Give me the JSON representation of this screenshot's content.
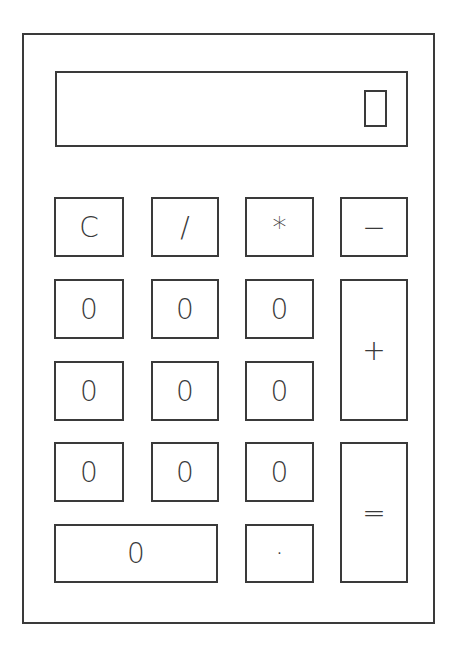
{
  "display": {
    "value": ""
  },
  "keys": [
    {
      "id": "clear",
      "label": "C"
    },
    {
      "id": "divide",
      "label": "/"
    },
    {
      "id": "multiply",
      "label": "*"
    },
    {
      "id": "minus",
      "label": "−"
    },
    {
      "id": "digit-r2c1",
      "label": "0"
    },
    {
      "id": "digit-r2c2",
      "label": "0"
    },
    {
      "id": "digit-r2c3",
      "label": "0"
    },
    {
      "id": "plus",
      "label": "+"
    },
    {
      "id": "digit-r3c1",
      "label": "0"
    },
    {
      "id": "digit-r3c2",
      "label": "0"
    },
    {
      "id": "digit-r3c3",
      "label": "0"
    },
    {
      "id": "digit-r4c1",
      "label": "0"
    },
    {
      "id": "digit-r4c2",
      "label": "0"
    },
    {
      "id": "digit-r4c3",
      "label": "0"
    },
    {
      "id": "equals",
      "label": "="
    },
    {
      "id": "zero-wide",
      "label": "0"
    },
    {
      "id": "decimal",
      "label": "·"
    }
  ]
}
